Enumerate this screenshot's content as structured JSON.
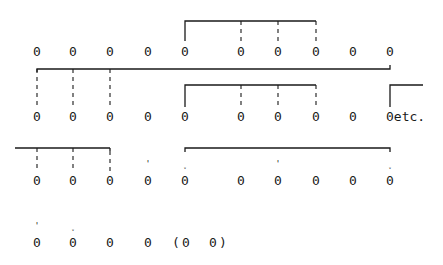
{
  "diagram": {
    "rows": [
      {
        "y": 52,
        "cells": [
          {
            "x": 37,
            "text": "0"
          },
          {
            "x": 73,
            "text": "0"
          },
          {
            "x": 110,
            "text": "0"
          },
          {
            "x": 148,
            "text": "0"
          },
          {
            "x": 185,
            "text": "0"
          },
          {
            "x": 241,
            "text": "0"
          },
          {
            "x": 278,
            "text": "0"
          },
          {
            "x": 316,
            "text": "0"
          },
          {
            "x": 353,
            "text": "0"
          },
          {
            "x": 390,
            "text": "0"
          }
        ]
      },
      {
        "y": 117,
        "cells": [
          {
            "x": 37,
            "text": "0"
          },
          {
            "x": 73,
            "text": "0"
          },
          {
            "x": 110,
            "text": "0"
          },
          {
            "x": 148,
            "text": "0"
          },
          {
            "x": 185,
            "text": "0"
          },
          {
            "x": 241,
            "text": "0"
          },
          {
            "x": 278,
            "text": "0"
          },
          {
            "x": 316,
            "text": "0"
          },
          {
            "x": 353,
            "text": "0"
          }
        ],
        "trailing": {
          "x": 386,
          "text": "0etc."
        }
      },
      {
        "y": 181,
        "cells": [
          {
            "x": 37,
            "text": "0"
          },
          {
            "x": 73,
            "text": "0"
          },
          {
            "x": 110,
            "text": "0"
          },
          {
            "x": 148,
            "text": "0"
          },
          {
            "x": 185,
            "text": "0"
          },
          {
            "x": 241,
            "text": "0"
          },
          {
            "x": 278,
            "text": "0"
          },
          {
            "x": 316,
            "text": "0"
          },
          {
            "x": 353,
            "text": "0"
          },
          {
            "x": 390,
            "text": "0"
          }
        ]
      },
      {
        "y": 243,
        "cells": [
          {
            "x": 37,
            "text": "0"
          },
          {
            "x": 73,
            "text": "0"
          },
          {
            "x": 110,
            "text": "0"
          },
          {
            "x": 148,
            "text": "0"
          },
          {
            "x": 176,
            "text": "("
          },
          {
            "x": 186,
            "text": "0"
          },
          {
            "x": 213,
            "text": "0"
          },
          {
            "x": 223,
            "text": ")"
          }
        ]
      }
    ],
    "marks": [
      {
        "x": 148,
        "y": 164,
        "text": "'"
      },
      {
        "x": 185,
        "y": 164,
        "text": "˯"
      },
      {
        "x": 278,
        "y": 164,
        "text": "'"
      },
      {
        "x": 390,
        "y": 164,
        "text": "˯"
      },
      {
        "x": 37,
        "y": 226,
        "text": "'"
      },
      {
        "x": 73,
        "y": 226,
        "text": "˯"
      }
    ],
    "trailing_label": "etc."
  }
}
